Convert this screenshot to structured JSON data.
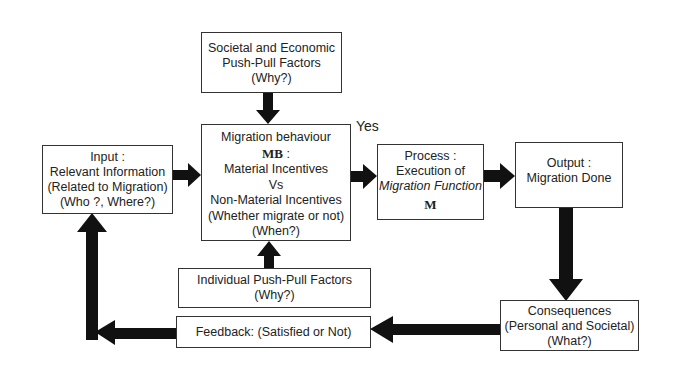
{
  "diagram": {
    "societal_box": {
      "lines": [
        "Societal and Economic",
        "Push-Pull Factors",
        "(Why?)"
      ]
    },
    "migration_box": {
      "title": "Migration behaviour",
      "symbol": "MB",
      "symbol_suffix": " :",
      "lines": [
        "Material Incentives",
        "Vs",
        "Non-Material Incentives",
        "(Whether migrate or not)",
        "(When?)"
      ]
    },
    "input_box": {
      "lines": [
        "Input :",
        "Relevant Information",
        "(Related to Migration)",
        "(Who ?, Where?)"
      ]
    },
    "process_box": {
      "line1": "Process :",
      "line2": "Execution of",
      "line3": "Migration Function",
      "symbol": "M"
    },
    "output_box": {
      "lines": [
        "Output :",
        "Migration Done"
      ]
    },
    "individual_box": {
      "lines": [
        "Individual Push-Pull Factors",
        "(Why?)"
      ]
    },
    "feedback_box": {
      "label": "Feedback: (Satisfied or Not)"
    },
    "consequences_box": {
      "lines": [
        "Consequences",
        "(Personal and Societal)",
        "(What?)"
      ]
    },
    "yes_label": "Yes",
    "arrow_color": "#111111"
  }
}
